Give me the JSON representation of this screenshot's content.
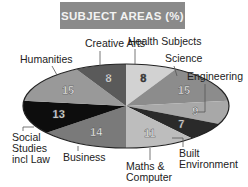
{
  "chart_data": {
    "type": "pie",
    "title": "SUBJECT AREAS (%)",
    "categories": [
      "Health Subjects",
      "Science",
      "Engineering",
      "Built Environment",
      "Maths & Computer",
      "Business",
      "Social Studies incl Law",
      "Humanities",
      "Creative Arts"
    ],
    "values": [
      8,
      15,
      9,
      7,
      11,
      14,
      13,
      15,
      8
    ],
    "colors": [
      "#d2d2d2",
      "#8c8c8c",
      "#a8a8a8",
      "#2a2a2a",
      "#bdbdbd",
      "#7a7a7a",
      "#0d0d0d",
      "#999999",
      "#5a5a5a"
    ],
    "label_colors": [
      "#333333",
      "#f5f5f5",
      "#f5f5f5",
      "#f5f5f5",
      "#f5f5f5",
      "#f5f5f5",
      "#f5f5f5",
      "#f5f5f5",
      "#f5f5f5"
    ],
    "start": "12 o'clock, clockwise",
    "style": "3D tilted ellipse",
    "legend": "none (callout labels)"
  },
  "title": "SUBJECT AREAS (%)",
  "labels": {
    "health": "Health Subjects",
    "science": "Science",
    "engineering": "Engineering",
    "built_1": "Built",
    "built_2": "Environment",
    "maths_1": "Maths &",
    "maths_2": "Computer",
    "business": "Business",
    "social_1": "Social",
    "social_2": "Studies",
    "social_3": "incl Law",
    "humanities": "Humanities",
    "creative": "Creative Arts"
  }
}
